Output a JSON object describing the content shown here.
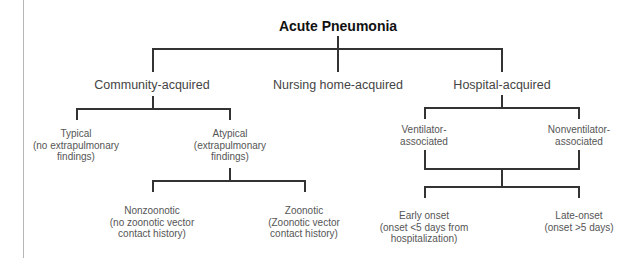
{
  "diagram": {
    "title": "Acute Pneumonia",
    "level1": {
      "community": "Community-acquired",
      "nursing": "Nursing home-acquired",
      "hospital": "Hospital-acquired"
    },
    "community_children": {
      "typical": {
        "line1": "Typical",
        "line2": "(no extrapulmonary",
        "line3": "findings)"
      },
      "atypical": {
        "line1": "Atypical",
        "line2": "(extrapulmonary",
        "line3": "findings)"
      }
    },
    "atypical_children": {
      "nonzoonotic": {
        "line1": "Nonzoonotic",
        "line2": "(no zoonotic vector",
        "line3": "contact history)"
      },
      "zoonotic": {
        "line1": "Zoonotic",
        "line2": "(Zoonotic vector",
        "line3": "contact history)"
      }
    },
    "hospital_children": {
      "ventilator": {
        "line1": "Ventilator-",
        "line2": "associated"
      },
      "nonventilator": {
        "line1": "Nonventilator-",
        "line2": "associated"
      }
    },
    "onset_children": {
      "early": {
        "line1": "Early onset",
        "line2": "(onset <5 days from",
        "line3": "hospitalization)"
      },
      "late": {
        "line1": "Late-onset",
        "line2": "(onset >5 days)"
      }
    }
  }
}
